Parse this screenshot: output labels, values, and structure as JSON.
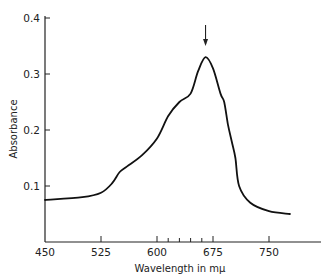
{
  "chart_data": {
    "type": "line",
    "title": "",
    "xlabel": "Wavelength in mμ",
    "ylabel": "Absorbance",
    "xlim": [
      450,
      800
    ],
    "ylim": [
      0,
      0.4
    ],
    "grid": false,
    "legend": null,
    "x_ticks": [
      450,
      525,
      600,
      675,
      750
    ],
    "x_tick_labels": [
      "450",
      "525",
      "600",
      "675",
      "750"
    ],
    "x_minor_ticks": [
      615,
      630,
      645,
      660
    ],
    "y_ticks": [
      0.1,
      0.2,
      0.3,
      0.4
    ],
    "y_tick_labels": [
      "0.1",
      "0.2",
      "0.3",
      "0.4"
    ],
    "annotations": [
      {
        "type": "arrow",
        "x": 665,
        "label": "",
        "note": "downward arrow marking absorption maximum"
      }
    ],
    "series": [
      {
        "name": "Absorbance",
        "x": [
          450,
          500,
          525,
          540,
          550,
          560,
          580,
          600,
          615,
          630,
          645,
          655,
          665,
          675,
          685,
          690,
          695,
          700,
          705,
          710,
          725,
          750,
          778
        ],
        "values": [
          0.075,
          0.08,
          0.088,
          0.105,
          0.125,
          0.135,
          0.155,
          0.185,
          0.225,
          0.25,
          0.265,
          0.305,
          0.33,
          0.31,
          0.265,
          0.25,
          0.21,
          0.18,
          0.15,
          0.1,
          0.07,
          0.055,
          0.05
        ]
      }
    ]
  },
  "colors": {
    "line": "#111111",
    "axis": "#222222",
    "background": "#ffffff"
  }
}
